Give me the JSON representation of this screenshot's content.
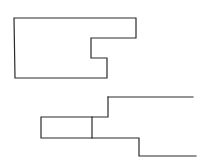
{
  "diagram": {
    "background": "#ffffff",
    "stroke_color": "#2a2a2a",
    "shapes": [
      {
        "name": "top-notched-outline",
        "type": "polygon",
        "points": "14,18 136,18 136,38 91,38 91,58 107,58 107,78 15,78"
      },
      {
        "name": "bottom-stepped-outline",
        "type": "polyline-group",
        "paths": [
          "M108,97 L193,97",
          "M108,97 L108,117 L41,117 L41,138 L139,138 L139,156 L196,156",
          "M92,117 L92,138"
        ]
      }
    ]
  }
}
